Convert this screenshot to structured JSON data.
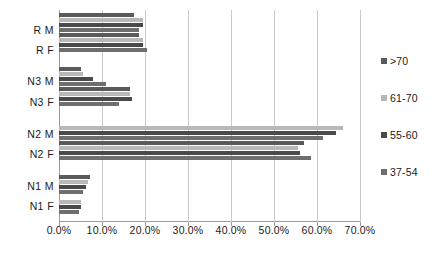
{
  "chart_data": {
    "type": "bar",
    "orientation": "horizontal",
    "title": "",
    "xlabel": "",
    "ylabel": "",
    "xlim": [
      0,
      70
    ],
    "xtick_labels": [
      "0.0%",
      "10.0%",
      "20.0%",
      "30.0%",
      "40.0%",
      "50.0%",
      "60.0%",
      "70.0%"
    ],
    "xticks": [
      0,
      10,
      20,
      30,
      40,
      50,
      60,
      70
    ],
    "grid": true,
    "legend_position": "right",
    "categories": [
      "N1 F",
      "N1 M",
      "N2 F",
      "N2 M",
      "N3 F",
      "N3 M",
      "R F",
      "R M"
    ],
    "series": [
      {
        "name": "37-54",
        "color": "#6e6e6e",
        "values": [
          4.6,
          5.6,
          58.5,
          61.5,
          14.0,
          11.0,
          20.5,
          18.5
        ]
      },
      {
        "name": "55-60",
        "color": "#4a4a4a",
        "values": [
          5.0,
          6.2,
          56.0,
          64.5,
          17.0,
          8.0,
          19.5,
          19.5
        ]
      },
      {
        "name": "61-70",
        "color": "#b8b8b8",
        "values": [
          5.0,
          6.8,
          55.5,
          66.0,
          16.5,
          5.5,
          19.5,
          19.5
        ]
      },
      {
        "name": ">70",
        "color": "#5a5a5a",
        "values": [
          0.0,
          7.2,
          57.0,
          0.0,
          16.5,
          5.0,
          18.5,
          17.5
        ]
      }
    ]
  },
  "legend": {
    "items": [
      {
        "label": ">70",
        "color": "#5a5a5a"
      },
      {
        "label": "61-70",
        "color": "#b8b8b8"
      },
      {
        "label": "55-60",
        "color": "#4a4a4a"
      },
      {
        "label": "37-54",
        "color": "#6e6e6e"
      }
    ]
  },
  "axis": {
    "category_labels": [
      "R M",
      "R F",
      "N3 M",
      "N3 F",
      "N2 M",
      "N2 F",
      "N1 M",
      "N1 F"
    ],
    "x_tick_labels": [
      "0.0%",
      "10.0%",
      "20.0%",
      "30.0%",
      "40.0%",
      "50.0%",
      "60.0%",
      "70.0%"
    ]
  }
}
